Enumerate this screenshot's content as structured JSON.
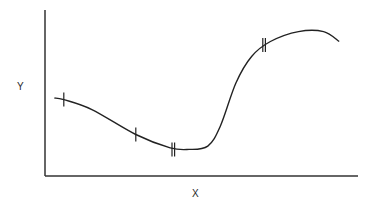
{
  "chart_data": {
    "type": "line",
    "title": "",
    "xlabel": "X",
    "ylabel": "Y",
    "grid": false,
    "legend": null,
    "axis_ticks": "none",
    "x": [
      3,
      6,
      15,
      29,
      40,
      46,
      52,
      56,
      61,
      66,
      72,
      81,
      89,
      94
    ],
    "values": [
      47,
      46,
      40,
      25,
      17,
      16,
      18,
      30,
      56,
      72,
      81,
      87,
      87,
      81
    ],
    "markers": [
      {
        "x": 6,
        "y": 46,
        "style": "single-tick"
      },
      {
        "x": 29,
        "y": 25,
        "style": "single-tick"
      },
      {
        "x": 41,
        "y": 16,
        "style": "double-tick"
      },
      {
        "x": 70,
        "y": 79,
        "style": "double-tick"
      }
    ],
    "xlim": [
      0,
      100
    ],
    "ylim": [
      0,
      100
    ]
  },
  "labels": {
    "x_axis": "X",
    "y_axis": "Y"
  },
  "colors": {
    "stroke": "#222222",
    "axis": "#333333",
    "background": "#ffffff"
  }
}
